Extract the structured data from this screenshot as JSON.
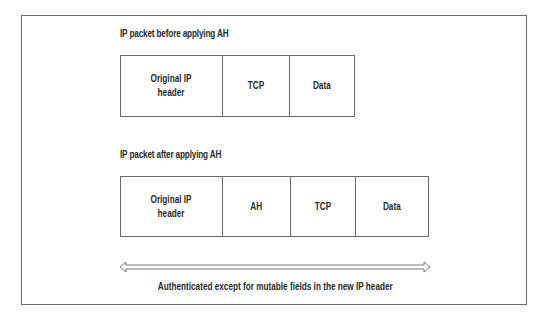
{
  "diagram": {
    "before": {
      "title": "IP packet before applying AH",
      "cells": [
        {
          "label": "Original IP\nheader"
        },
        {
          "label": "TCP"
        },
        {
          "label": "Data"
        }
      ]
    },
    "after": {
      "title": "IP packet after applying AH",
      "cells": [
        {
          "label": "Original IP\nheader"
        },
        {
          "label": "AH"
        },
        {
          "label": "TCP"
        },
        {
          "label": "Data"
        }
      ]
    },
    "arrow": {
      "direction": "double-headed"
    },
    "caption": "Authenticated except for mutable fields in the new IP header"
  }
}
